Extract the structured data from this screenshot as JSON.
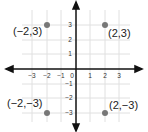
{
  "diagram": {
    "type": "coordinate-plane",
    "x_ticks": [
      "-3",
      "-2",
      "-1",
      "0",
      "1",
      "2",
      "3"
    ],
    "y_ticks": [
      "3",
      "2",
      "1",
      "-1",
      "-2",
      "-3"
    ],
    "points": [
      {
        "label": "(−2,3)",
        "x": -2,
        "y": 3
      },
      {
        "label": "(2,3)",
        "x": 2,
        "y": 3
      },
      {
        "label": "(−2,−3)",
        "x": -2,
        "y": -3
      },
      {
        "label": "(2,−3)",
        "x": 2,
        "y": -3
      }
    ],
    "colors": {
      "axis": "#111111",
      "grid": "#dddddd",
      "point": "#777777"
    }
  }
}
